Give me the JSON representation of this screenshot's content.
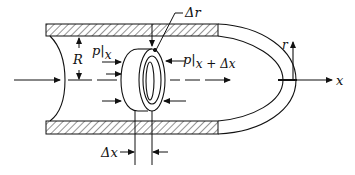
{
  "diagram": {
    "labels": {
      "radius": "R",
      "delta_r": "Δr",
      "pressure_in_symbol": "p",
      "pressure_in_sub": "x",
      "pressure_out_symbol": "p",
      "pressure_out_sub": "x + Δx",
      "delta_x": "Δx",
      "axis_r": "r",
      "axis_x": "x"
    },
    "colors": {
      "line": "#111111",
      "background": "#ffffff"
    }
  }
}
